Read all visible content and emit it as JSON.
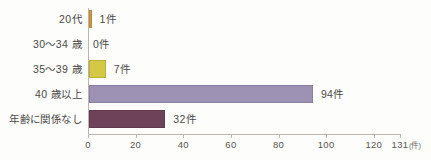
{
  "chart_data": {
    "type": "bar",
    "orientation": "horizontal",
    "title": "",
    "xlabel": "(件)",
    "ylabel": "",
    "xlim": [
      0,
      131
    ],
    "grid": false,
    "legend": null,
    "categories": [
      "20代",
      "30〜34 歳",
      "35〜39 歳",
      "40 歳以上",
      "年齢に関係なし"
    ],
    "values": [
      1,
      0,
      7,
      94,
      32
    ],
    "value_labels": [
      "1件",
      "0件",
      "7件",
      "94件",
      "32件"
    ],
    "colors": [
      "#d89a3c",
      "#d8d8d8",
      "#d4c844",
      "#9d92b4",
      "#6e4258"
    ],
    "xticks": [
      0,
      20,
      40,
      60,
      80,
      100,
      120,
      131
    ],
    "xtick_labels": [
      "0",
      "20",
      "40",
      "60",
      "80",
      "100",
      "120",
      "131"
    ],
    "unit_label": "(件)",
    "axis_color": "#b9b6b0",
    "text_color": "#4b4945",
    "background": "#fdfdfc"
  }
}
